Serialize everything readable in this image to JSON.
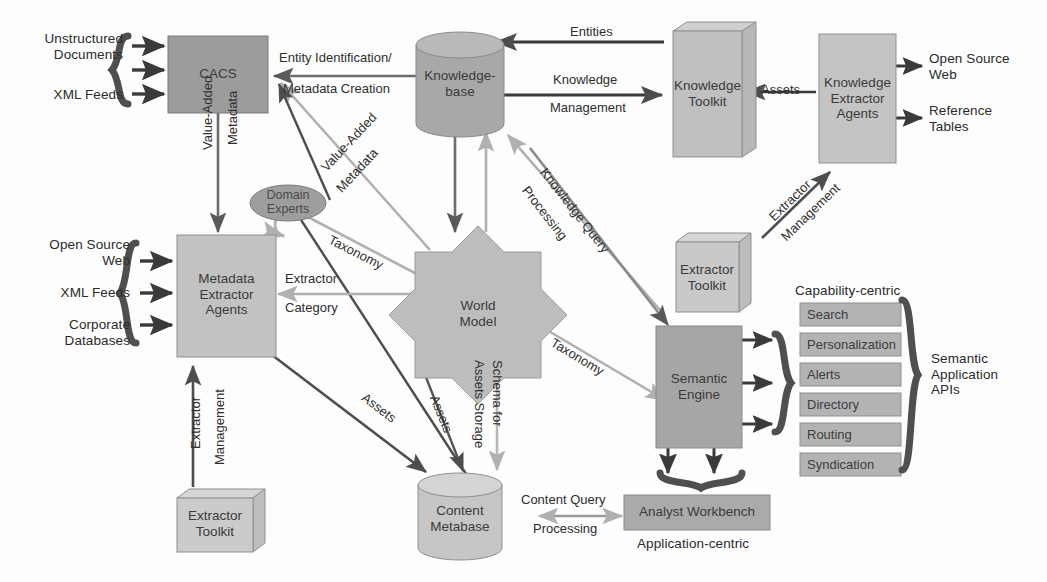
{
  "diagram": {
    "colors": {
      "box_dark": "#9a9a9a",
      "box_mid": "#b4b4b4",
      "box_light": "#c6c6c6",
      "box_pale": "#cfcfcf",
      "cyl_dark": "#a3a3a3",
      "cyl_light": "#c9c9c9",
      "ellipse": "#9e9e9e",
      "stroke_dark": "#4d4d4d",
      "stroke_light": "#b0b0b0",
      "brace": "#6e6e6e",
      "text": "#2a2a2a"
    }
  },
  "nodes": {
    "cacs": {
      "label": "CACS"
    },
    "knowledgebase": {
      "label": "Knowledge-\nbase"
    },
    "knowledge_toolkit": {
      "label": "Knowledge\nToolkit"
    },
    "knowledge_extractor_agents": {
      "label": "Knowledge\nExtractor\nAgents"
    },
    "metadata_extractor_agents": {
      "label": "Metadata\nExtractor\nAgents"
    },
    "domain_experts": {
      "label": "Domain\nExperts"
    },
    "world_model": {
      "label": "World\nModel"
    },
    "extractor_toolkit_right": {
      "label": "Extractor\nToolkit"
    },
    "extractor_toolkit_left": {
      "label": "Extractor\nToolkit"
    },
    "semantic_engine": {
      "label": "Semantic\nEngine"
    },
    "content_metabase": {
      "label": "Content\nMetabase"
    },
    "analyst_workbench": {
      "label": "Analyst Workbench"
    }
  },
  "inputs": {
    "cacs_sources": [
      {
        "label": "Unstructured\nDocuments"
      },
      {
        "label": "XML Feeds"
      }
    ],
    "metadata_sources": [
      {
        "label": "Open Source\nWeb"
      },
      {
        "label": "XML Feeds"
      },
      {
        "label": "Corporate\nDatabases"
      }
    ]
  },
  "outputs": {
    "extractor_targets": [
      {
        "label": "Open Source\nWeb"
      },
      {
        "label": "Reference\nTables"
      }
    ]
  },
  "capabilities": {
    "group_label": "Capability-centric",
    "api_label": "Semantic\nApplication\nAPIs",
    "items": [
      {
        "label": "Search"
      },
      {
        "label": "Personalization"
      },
      {
        "label": "Alerts"
      },
      {
        "label": "Directory"
      },
      {
        "label": "Routing"
      },
      {
        "label": "Syndication"
      }
    ]
  },
  "annotations": {
    "application_centric": "Application-centric"
  },
  "edges": [
    {
      "id": "entity-identification",
      "label": "Entity Identification/\nMetadata Creation"
    },
    {
      "id": "entities",
      "label": "Entities"
    },
    {
      "id": "knowledge-management",
      "label": "Knowledge\nManagement"
    },
    {
      "id": "assets-kea",
      "label": "Assets"
    },
    {
      "id": "value-added-metadata-cacs",
      "label": "Value-Added\nMetadata"
    },
    {
      "id": "value-added-metadata-diag",
      "label": "Value-Added\nMetadata"
    },
    {
      "id": "taxonomy-left",
      "label": "Taxonomy"
    },
    {
      "id": "taxonomy-right",
      "label": "Taxonomy"
    },
    {
      "id": "extractor-category",
      "label": "Extractor\nCategory"
    },
    {
      "id": "extractor-management-left",
      "label": "Extractor\nManagement"
    },
    {
      "id": "extractor-management-right",
      "label": "Extractor\nManagement"
    },
    {
      "id": "knowledge-query-processing",
      "label": "Knowledge Query\nProcessing"
    },
    {
      "id": "schema-for-assets-storage",
      "label": "Schema for\nAssets Storage"
    },
    {
      "id": "assets-mea",
      "label": "Assets"
    },
    {
      "id": "assets-world",
      "label": "Assets"
    },
    {
      "id": "content-query-processing",
      "label": "Content Query\nProcessing"
    }
  ],
  "edge_labels": {
    "entity_identification_l1": "Entity Identification/",
    "entity_identification_l2": "Metadata Creation",
    "entities": "Entities",
    "knowledge_management_l1": "Knowledge",
    "knowledge_management_l2": "Management",
    "assets_kea": "Assets",
    "vam_cacs_l1": "Value-Added",
    "vam_cacs_l2": "Metadata",
    "vam_diag_l1": "Value-Added",
    "vam_diag_l2": "Metadata",
    "taxonomy_left": "Taxonomy",
    "taxonomy_right": "Taxonomy",
    "extractor_category_l1": "Extractor",
    "extractor_category_l2": "Category",
    "extractor_mgmt_l1": "Extractor",
    "extractor_mgmt_l2": "Management",
    "extractor_mgmt_r1": "Extractor",
    "extractor_mgmt_r2": "Management",
    "kqp_l1": "Knowledge Query",
    "kqp_l2": "Processing",
    "schema_l1": "Schema for",
    "schema_l2": "Assets Storage",
    "assets_mea": "Assets",
    "assets_world": "Assets",
    "cqp_l1": "Content Query",
    "cqp_l2": "Processing"
  }
}
